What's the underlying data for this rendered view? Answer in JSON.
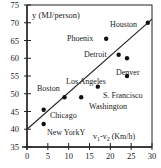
{
  "chart_data": {
    "type": "scatter",
    "title": "",
    "xlabel": "v1-v2 (Km/h)",
    "xlabel_parts": {
      "v1": "v",
      "sub1": "1",
      "dash": "-v",
      "sub2": "2",
      "unit": " (Km/h)"
    },
    "ylabel": "y (MJ/person)",
    "xlim": [
      0,
      30
    ],
    "ylim": [
      35,
      75
    ],
    "x_ticks": [
      0,
      5,
      10,
      15,
      20,
      25,
      30
    ],
    "y_ticks": [
      35,
      40,
      45,
      50,
      55,
      60,
      65,
      70,
      75
    ],
    "grid": false,
    "legend": null,
    "points": [
      {
        "label": "Houston",
        "x": 29,
        "y": 70
      },
      {
        "label": "Phoenix",
        "x": 19,
        "y": 65.5
      },
      {
        "label": "Detroit",
        "x": 22,
        "y": 61
      },
      {
        "label": "Denver",
        "x": 24,
        "y": 60
      },
      {
        "label": "Los Angeles",
        "x": 24,
        "y": 55
      },
      {
        "label": "S. Francisco",
        "x": 17,
        "y": 52
      },
      {
        "label": "Washington",
        "x": 13,
        "y": 49
      },
      {
        "label": "Boston",
        "x": 9,
        "y": 49
      },
      {
        "label": "Chicago",
        "x": 4,
        "y": 45.5
      },
      {
        "label": "New York",
        "x": 4,
        "y": 41.5
      }
    ],
    "regression_line": {
      "x0": 0,
      "y0": 40,
      "x1": 30,
      "y1": 71
    },
    "annotations": [
      "Y"
    ]
  },
  "labels": {
    "houston": "Houston",
    "phoenix": "Phoenix",
    "detroit": "Detroit",
    "denver": "Denver",
    "los_angeles": "Los Angeles",
    "s_francisco": "S. Francisco",
    "washington": "Washington",
    "boston": "Boston",
    "chicago": "Chicago",
    "new_york": "New YorkY",
    "ylabel": "y (MJ/person)"
  }
}
